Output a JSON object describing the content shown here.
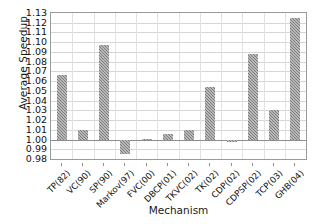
{
  "chart_data": {
    "type": "bar",
    "title": "",
    "xlabel": "Mechanism",
    "ylabel": "Average Speedup",
    "categories": [
      "TP(82)",
      "VC(90)",
      "SP(90)",
      "Markov(97)",
      "FVC(00)",
      "DBCP(01)",
      "TKVC(02)",
      "TK(02)",
      "CDP(02)",
      "CDPSP(02)",
      "TCP(03)",
      "GHB(04)"
    ],
    "values": [
      1.066,
      1.01,
      1.097,
      0.985,
      1.001,
      1.006,
      1.0095,
      1.0535,
      0.9975,
      1.0875,
      1.0305,
      1.125
    ],
    "baseline": 1.0,
    "ylim": [
      0.98,
      1.13
    ],
    "ytick_step": 0.01,
    "ytick_labels": [
      "1.13",
      "1.12",
      "1.11",
      "1.10",
      "1.09",
      "1.08",
      "1.07",
      "1.06",
      "1.05",
      "1.04",
      "1.03",
      "1.02",
      "1.01",
      "1.00",
      "0.99",
      "0.98"
    ],
    "grid": true,
    "legend": null,
    "bar_color": "#7d7d7d",
    "axis_color": "#8d8d8d",
    "gridline_color": "#d6d6d6"
  }
}
